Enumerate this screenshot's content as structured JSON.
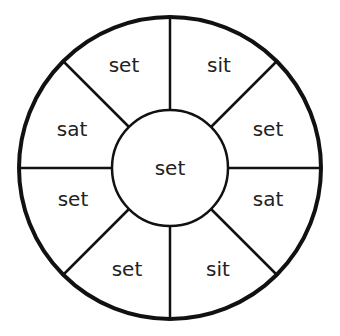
{
  "wheel": {
    "center_word": "set",
    "segments": [
      {
        "label": "sit"
      },
      {
        "label": "set"
      },
      {
        "label": "sat"
      },
      {
        "label": "sit"
      },
      {
        "label": "set"
      },
      {
        "label": "set"
      },
      {
        "label": "sat"
      },
      {
        "label": "set"
      }
    ]
  }
}
